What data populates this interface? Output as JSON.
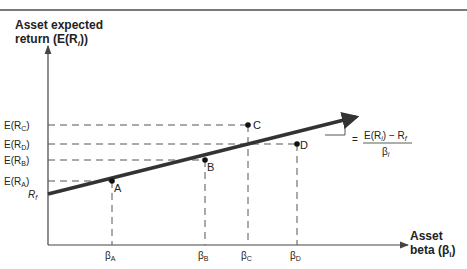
{
  "y_axis": {
    "line1": "Asset expected",
    "line2": "return (E(R",
    "line2_sub": "i",
    "line2_end": "))"
  },
  "x_axis": {
    "line1": "Asset",
    "line2": "beta (β",
    "line2_sub": "i",
    "line2_end": ")"
  },
  "y_ticks": [
    {
      "pre": "E(R",
      "sub": "C",
      "post": ")"
    },
    {
      "pre": "E(R",
      "sub": "D",
      "post": ")"
    },
    {
      "pre": "E(R",
      "sub": "B",
      "post": ")"
    },
    {
      "pre": "E(R",
      "sub": "A",
      "post": ")"
    },
    {
      "pre": "R",
      "sub": "f",
      "post": ""
    }
  ],
  "x_ticks": [
    {
      "pre": "β",
      "sub": "A"
    },
    {
      "pre": "β",
      "sub": "B"
    },
    {
      "pre": "β",
      "sub": "C"
    },
    {
      "pre": "β",
      "sub": "D"
    }
  ],
  "points": [
    {
      "label": "A",
      "position": "on line"
    },
    {
      "label": "B",
      "position": "on line"
    },
    {
      "label": "C",
      "position": "above line"
    },
    {
      "label": "D",
      "position": "below line"
    }
  ],
  "slope_formula": {
    "equals": "=",
    "numerator_pre": "E(R",
    "numerator_sub": "i",
    "numerator_post": ") − R",
    "numerator_sub2": "f",
    "denominator": "β",
    "denominator_sub": "i"
  },
  "colors": {
    "line": "#333333",
    "axis": "#444444",
    "text": "#222222"
  }
}
